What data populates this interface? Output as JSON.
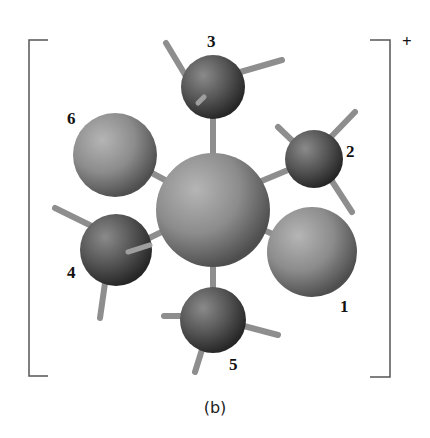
{
  "figure": {
    "caption": "(b)",
    "charge": "+",
    "atom_labels": [
      {
        "id": "1",
        "text": "1"
      },
      {
        "id": "2",
        "text": "2"
      },
      {
        "id": "3",
        "text": "3"
      },
      {
        "id": "4",
        "text": "4"
      },
      {
        "id": "5",
        "text": "5"
      },
      {
        "id": "6",
        "text": "6"
      }
    ],
    "colors": {
      "bracket": "#555555",
      "bond": "#9a9a9a",
      "large_atom": "#8a8a8a",
      "methyl_carbon": "#555555",
      "label": "#111111"
    }
  }
}
